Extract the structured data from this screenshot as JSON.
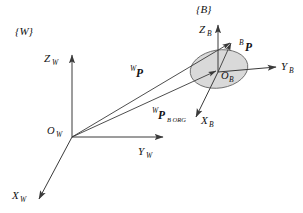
{
  "figure": {
    "background_color": "#ffffff",
    "line_color": "#3a3a3a",
    "text_color": "#111111",
    "body_fill_color": "#d9d9d9",
    "body_stroke_color": "#555555",
    "width": 303,
    "height": 213
  },
  "frames": {
    "world": {
      "label": "{W}",
      "origin_label": "O",
      "origin_subscript": "W",
      "axes": [
        {
          "name": "x-axis-world",
          "label": "X",
          "subscript": "W"
        },
        {
          "name": "y-axis-world",
          "label": "Y",
          "subscript": "W"
        },
        {
          "name": "z-axis-world",
          "label": "Z",
          "subscript": "W"
        }
      ]
    },
    "body": {
      "label": "{B}",
      "origin_label": "O",
      "origin_subscript": "B",
      "axes": [
        {
          "name": "x-axis-body",
          "label": "X",
          "subscript": "B"
        },
        {
          "name": "y-axis-body",
          "label": "Y",
          "subscript": "B"
        },
        {
          "name": "z-axis-body",
          "label": "Z",
          "subscript": "B"
        }
      ]
    }
  },
  "vectors": [
    {
      "name": "world-position-vector",
      "superscript": "W",
      "symbol": "P",
      "subscript": "",
      "description": "Position of point P expressed in world frame"
    },
    {
      "name": "body-position-vector",
      "superscript": "B",
      "symbol": "P",
      "subscript": "",
      "description": "Position of point P expressed in body frame"
    },
    {
      "name": "body-origin-vector",
      "superscript": "W",
      "symbol": "P",
      "subscript": "B ORG",
      "description": "Position of body frame origin expressed in world frame"
    }
  ]
}
